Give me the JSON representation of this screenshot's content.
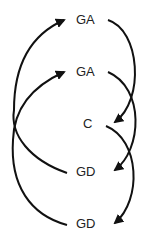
{
  "diagram": {
    "nodes": [
      {
        "id": "ga1",
        "label": "GA",
        "x": 76,
        "y": 13
      },
      {
        "id": "ga2",
        "label": "GA",
        "x": 76,
        "y": 65
      },
      {
        "id": "c",
        "label": "C",
        "x": 83,
        "y": 117
      },
      {
        "id": "gd1",
        "label": "GD",
        "x": 76,
        "y": 165
      },
      {
        "id": "gd2",
        "label": "GD",
        "x": 76,
        "y": 217
      }
    ],
    "edges": [
      {
        "from": "ga1",
        "to": "c"
      },
      {
        "from": "ga2",
        "to": "gd1"
      },
      {
        "from": "c",
        "to": "gd2"
      },
      {
        "from": "gd1",
        "to": "ga1"
      },
      {
        "from": "gd2",
        "to": "ga2"
      }
    ],
    "line_color": "#111111"
  }
}
